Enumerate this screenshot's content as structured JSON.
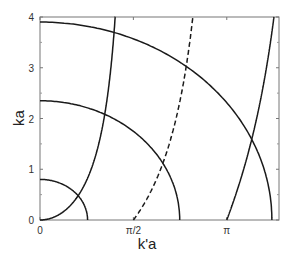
{
  "chart_data": {
    "type": "line",
    "title": "",
    "xlabel": "k'a",
    "ylabel": "ka",
    "xlim": [
      0,
      4.02
    ],
    "ylim": [
      0,
      4
    ],
    "x_ticks": [
      {
        "value": 0,
        "label": "0"
      },
      {
        "value": 1.5708,
        "label": "π/2"
      },
      {
        "value": 3.1416,
        "label": "π"
      }
    ],
    "y_ticks": [
      {
        "value": 0,
        "label": "0"
      },
      {
        "value": 1,
        "label": "1"
      },
      {
        "value": 2,
        "label": "2"
      },
      {
        "value": 3,
        "label": "3"
      },
      {
        "value": 4,
        "label": "4"
      }
    ],
    "grid": false,
    "legend": null,
    "series": [
      {
        "name": "circle R=0.8",
        "kind": "circle",
        "radius": 0.8,
        "style": "solid"
      },
      {
        "name": "circle R=2.35",
        "kind": "circle",
        "radius": 2.35,
        "style": "solid"
      },
      {
        "name": "circle R=3.9",
        "kind": "circle",
        "radius": 3.9,
        "style": "solid"
      },
      {
        "name": "ka = k'a tan(k'a), branch 1",
        "kind": "tan",
        "x_start": 0,
        "x_end": 1.5708,
        "style": "solid"
      },
      {
        "name": "ka = -k'a cot(k'a)",
        "kind": "negcot",
        "x_start": 1.5708,
        "x_end": 3.1416,
        "style": "dashed"
      },
      {
        "name": "ka = k'a tan(k'a), branch 2",
        "kind": "tan",
        "x_start": 3.1416,
        "x_end": 4.02,
        "style": "solid"
      }
    ]
  }
}
